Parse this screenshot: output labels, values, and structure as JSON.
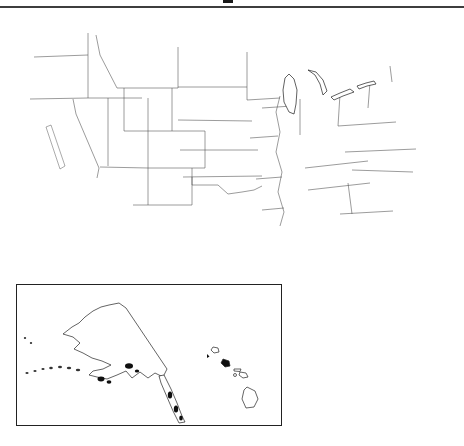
{
  "figure": {
    "kind": "county choropleth map",
    "region": "United States",
    "inset": "Alaska and Hawaii"
  },
  "legend": {
    "items": [
      {
        "label": "0 to 1.3 percent",
        "pattern": "white"
      },
      {
        "label": "1.3 to 1.9 percent",
        "pattern": "dots"
      },
      {
        "label": "1.9 to 2.6 percent",
        "pattern": "gray"
      },
      {
        "label": "2.6 to 3.9 percent",
        "pattern": "hatch"
      },
      {
        "label": "3.9 to 19.9 percent",
        "pattern": "black"
      }
    ]
  },
  "colors": {
    "gray": "#8f8f8f",
    "black": "#0f0f0f",
    "outline": "#1c1c1c",
    "state_line": "#4a4a4a",
    "rule": "#3d3d3d"
  },
  "map": {
    "counties": [
      [
        "b",
        46,
        33,
        11,
        8
      ],
      [
        "b",
        32,
        118,
        24,
        28
      ],
      [
        "b",
        57,
        120,
        36,
        30
      ],
      [
        "b",
        48,
        148,
        34,
        26
      ],
      [
        "b",
        36,
        162,
        14,
        16
      ],
      [
        "b",
        72,
        154,
        18,
        14
      ],
      [
        "b",
        131,
        160,
        15,
        16
      ],
      [
        "b",
        118,
        179,
        6,
        5
      ],
      [
        "b",
        219,
        166,
        14,
        11
      ],
      [
        "b",
        201,
        184,
        7,
        5
      ],
      [
        "b",
        293,
        114,
        10,
        9
      ],
      [
        "b",
        228,
        112,
        5,
        4
      ],
      [
        "b",
        398,
        89,
        8,
        7
      ],
      [
        "b",
        406,
        95,
        9,
        8
      ],
      [
        "b",
        414,
        102,
        8,
        5
      ],
      [
        "b",
        403,
        107,
        6,
        4
      ],
      [
        "b",
        394,
        98,
        5,
        4
      ],
      [
        "b",
        422,
        81,
        5,
        4
      ],
      [
        "b",
        286,
        231,
        6,
        5
      ],
      [
        "b",
        377,
        152,
        5,
        4
      ],
      [
        "b",
        429,
        69,
        4,
        3
      ],
      [
        "g",
        120,
        57,
        9,
        7
      ],
      [
        "g",
        80,
        85,
        7,
        6
      ],
      [
        "g",
        92,
        122,
        9,
        9
      ],
      [
        "g",
        102,
        152,
        9,
        11
      ],
      [
        "g",
        144,
        134,
        8,
        8
      ],
      [
        "g",
        188,
        114,
        6,
        5
      ],
      [
        "g",
        234,
        138,
        10,
        8
      ],
      [
        "g",
        212,
        153,
        9,
        7
      ],
      [
        "g",
        222,
        161,
        6,
        5
      ],
      [
        "g",
        248,
        171,
        8,
        6
      ],
      [
        "g",
        214,
        197,
        14,
        12
      ],
      [
        "g",
        209,
        227,
        8,
        6
      ],
      [
        "g",
        231,
        241,
        9,
        5
      ],
      [
        "g",
        181,
        185,
        7,
        5
      ],
      [
        "g",
        158,
        178,
        6,
        5
      ],
      [
        "g",
        190,
        212,
        7,
        5
      ],
      [
        "g",
        238,
        83,
        13,
        9
      ],
      [
        "g",
        264,
        108,
        11,
        10
      ],
      [
        "g",
        283,
        112,
        11,
        9
      ],
      [
        "g",
        306,
        102,
        14,
        11
      ],
      [
        "g",
        316,
        108,
        7,
        6
      ],
      [
        "g",
        274,
        130,
        7,
        6
      ],
      [
        "g",
        297,
        223,
        8,
        5
      ],
      [
        "g",
        319,
        227,
        7,
        4
      ],
      [
        "g",
        344,
        239,
        8,
        10
      ],
      [
        "g",
        357,
        253,
        9,
        7
      ],
      [
        "g",
        363,
        267,
        7,
        4
      ],
      [
        "g",
        345,
        121,
        7,
        5
      ],
      [
        "g",
        372,
        109,
        7,
        5
      ],
      [
        "g",
        392,
        73,
        7,
        5
      ],
      [
        "g",
        412,
        69,
        6,
        4
      ],
      [
        "g",
        249,
        93,
        6,
        5
      ],
      [
        "g",
        302,
        136,
        6,
        5
      ],
      [
        "g",
        331,
        181,
        7,
        4
      ],
      [
        "g",
        418,
        161,
        6,
        4
      ],
      [
        "d",
        243,
        55,
        9,
        12
      ],
      [
        "d",
        143,
        98,
        11,
        10
      ],
      [
        "d",
        247,
        67,
        7,
        6
      ],
      [
        "d",
        206,
        146,
        7,
        5
      ],
      [
        "d",
        389,
        83,
        5,
        4
      ],
      [
        "d",
        356,
        196,
        6,
        4
      ],
      [
        "h",
        52,
        39,
        9,
        6
      ],
      [
        "h",
        62,
        45,
        8,
        5
      ],
      [
        "h",
        58,
        104,
        13,
        10
      ],
      [
        "h",
        29,
        99,
        12,
        8
      ],
      [
        "h",
        41,
        111,
        8,
        6
      ],
      [
        "h",
        28,
        161,
        13,
        10
      ],
      [
        "h",
        38,
        173,
        10,
        8
      ],
      [
        "h",
        104,
        187,
        11,
        8
      ],
      [
        "h",
        136,
        203,
        8,
        6
      ],
      [
        "w",
        60,
        70,
        8,
        6
      ],
      [
        "w",
        75,
        108,
        7,
        5
      ],
      [
        "w",
        110,
        70,
        8,
        6
      ],
      [
        "w",
        140,
        60,
        7,
        5
      ],
      [
        "w",
        162,
        75,
        8,
        6
      ],
      [
        "w",
        186,
        60,
        7,
        6
      ],
      [
        "w",
        205,
        70,
        7,
        5
      ],
      [
        "w",
        225,
        62,
        6,
        5
      ],
      [
        "w",
        150,
        145,
        8,
        6
      ],
      [
        "w",
        165,
        160,
        7,
        5
      ],
      [
        "w",
        175,
        130,
        6,
        5
      ],
      [
        "w",
        200,
        120,
        7,
        6
      ],
      [
        "w",
        220,
        90,
        7,
        5
      ],
      [
        "w",
        196,
        105,
        7,
        5
      ],
      [
        "w",
        230,
        98,
        6,
        5
      ],
      [
        "w",
        152,
        90,
        8,
        6
      ],
      [
        "w",
        118,
        120,
        7,
        5
      ],
      [
        "w",
        128,
        142,
        6,
        5
      ],
      [
        "w",
        160,
        185,
        7,
        6
      ],
      [
        "w",
        150,
        200,
        6,
        5
      ],
      [
        "w",
        170,
        205,
        6,
        5
      ],
      [
        "w",
        185,
        230,
        7,
        5
      ],
      [
        "w",
        200,
        245,
        6,
        5
      ],
      [
        "w",
        215,
        235,
        6,
        5
      ],
      [
        "w",
        225,
        210,
        7,
        6
      ],
      [
        "w",
        238,
        205,
        6,
        5
      ],
      [
        "w",
        255,
        205,
        7,
        5
      ],
      [
        "w",
        250,
        185,
        6,
        5
      ],
      [
        "w",
        265,
        170,
        6,
        5
      ],
      [
        "w",
        260,
        155,
        6,
        5
      ],
      [
        "w",
        270,
        145,
        6,
        5
      ],
      [
        "w",
        255,
        135,
        6,
        5
      ],
      [
        "w",
        265,
        120,
        6,
        5
      ],
      [
        "w",
        250,
        105,
        6,
        5
      ],
      [
        "w",
        272,
        95,
        6,
        5
      ],
      [
        "w",
        262,
        85,
        6,
        5
      ],
      [
        "w",
        288,
        85,
        5,
        4
      ],
      [
        "w",
        252,
        70,
        7,
        5
      ],
      [
        "w",
        268,
        78,
        6,
        5
      ],
      [
        "w",
        243,
        110,
        6,
        5
      ],
      [
        "w",
        238,
        125,
        6,
        5
      ],
      [
        "w",
        232,
        150,
        6,
        5
      ],
      [
        "w",
        252,
        160,
        6,
        5
      ],
      [
        "w",
        246,
        178,
        6,
        5
      ],
      [
        "w",
        260,
        190,
        6,
        5
      ],
      [
        "w",
        270,
        200,
        6,
        5
      ],
      [
        "w",
        282,
        195,
        6,
        5
      ],
      [
        "w",
        290,
        205,
        6,
        5
      ],
      [
        "w",
        296,
        178,
        6,
        5
      ],
      [
        "w",
        290,
        150,
        6,
        5
      ],
      [
        "w",
        282,
        140,
        6,
        5
      ],
      [
        "w",
        295,
        128,
        6,
        5
      ],
      [
        "w",
        308,
        112,
        6,
        5
      ],
      [
        "w",
        305,
        92,
        6,
        5
      ],
      [
        "w",
        315,
        122,
        6,
        5
      ],
      [
        "w",
        318,
        135,
        6,
        5
      ],
      [
        "w",
        312,
        155,
        6,
        5
      ],
      [
        "w",
        322,
        165,
        6,
        5
      ],
      [
        "w",
        330,
        150,
        6,
        5
      ],
      [
        "w",
        338,
        140,
        6,
        5
      ],
      [
        "w",
        330,
        115,
        6,
        5
      ],
      [
        "w",
        322,
        105,
        6,
        5
      ],
      [
        "w",
        340,
        105,
        6,
        5
      ],
      [
        "w",
        352,
        98,
        6,
        5
      ],
      [
        "w",
        360,
        112,
        6,
        5
      ],
      [
        "w",
        368,
        130,
        6,
        5
      ],
      [
        "w",
        375,
        140,
        6,
        5
      ],
      [
        "w",
        380,
        155,
        6,
        5
      ],
      [
        "w",
        372,
        168,
        6,
        5
      ],
      [
        "w",
        362,
        178,
        6,
        5
      ],
      [
        "w",
        352,
        190,
        6,
        5
      ],
      [
        "w",
        342,
        200,
        6,
        5
      ],
      [
        "w",
        335,
        210,
        6,
        5
      ],
      [
        "w",
        345,
        222,
        6,
        5
      ],
      [
        "w",
        355,
        232,
        6,
        5
      ],
      [
        "w",
        360,
        248,
        5,
        4
      ],
      [
        "w",
        356,
        260,
        5,
        4
      ],
      [
        "w",
        300,
        210,
        6,
        4
      ],
      [
        "w",
        310,
        222,
        6,
        4
      ],
      [
        "w",
        322,
        230,
        6,
        4
      ],
      [
        "w",
        292,
        232,
        6,
        4
      ],
      [
        "w",
        272,
        230,
        6,
        4
      ],
      [
        "w",
        262,
        222,
        6,
        4
      ],
      [
        "w",
        252,
        230,
        5,
        4
      ],
      [
        "w",
        243,
        244,
        5,
        4
      ],
      [
        "w",
        228,
        247,
        5,
        4
      ],
      [
        "w",
        205,
        230,
        6,
        5
      ],
      [
        "w",
        196,
        220,
        6,
        5
      ],
      [
        "w",
        410,
        60,
        5,
        4
      ],
      [
        "w",
        418,
        66,
        5,
        4
      ],
      [
        "w",
        404,
        70,
        5,
        4
      ],
      [
        "w",
        396,
        76,
        5,
        4
      ],
      [
        "w",
        404,
        82,
        5,
        4
      ],
      [
        "w",
        412,
        88,
        5,
        4
      ],
      [
        "w",
        400,
        92,
        5,
        4
      ],
      [
        "w",
        390,
        88,
        5,
        4
      ],
      [
        "w",
        386,
        98,
        5,
        4
      ],
      [
        "w",
        394,
        106,
        5,
        4
      ],
      [
        "w",
        402,
        112,
        4,
        3
      ],
      [
        "w",
        396,
        118,
        5,
        4
      ],
      [
        "w",
        388,
        126,
        5,
        4
      ],
      [
        "w",
        396,
        134,
        5,
        4
      ],
      [
        "w",
        388,
        142,
        5,
        4
      ],
      [
        "w",
        398,
        150,
        5,
        4
      ],
      [
        "w",
        406,
        158,
        5,
        4
      ],
      [
        "w",
        400,
        166,
        5,
        4
      ],
      [
        "w",
        408,
        174,
        5,
        4
      ],
      [
        "w",
        398,
        178,
        5,
        4
      ],
      [
        "w",
        390,
        170,
        5,
        4
      ],
      [
        "w",
        382,
        162,
        5,
        4
      ],
      [
        "w",
        374,
        152,
        5,
        4
      ],
      [
        "w",
        366,
        162,
        5,
        4
      ],
      [
        "w",
        358,
        152,
        5,
        4
      ],
      [
        "w",
        350,
        162,
        5,
        4
      ],
      [
        "w",
        342,
        172,
        5,
        4
      ],
      [
        "w",
        334,
        162,
        5,
        4
      ],
      [
        "w",
        326,
        175,
        5,
        4
      ],
      [
        "w",
        318,
        185,
        5,
        4
      ],
      [
        "w",
        310,
        192,
        5,
        4
      ],
      [
        "w",
        302,
        185,
        5,
        4
      ],
      [
        "w",
        294,
        192,
        5,
        4
      ],
      [
        "w",
        286,
        202,
        5,
        4
      ],
      [
        "w",
        278,
        210,
        5,
        4
      ],
      [
        "w",
        348,
        242,
        5,
        4
      ],
      [
        "w",
        168,
        178,
        7,
        5
      ],
      [
        "w",
        152,
        162,
        7,
        5
      ],
      [
        "w",
        142,
        178,
        6,
        5
      ],
      [
        "w",
        192,
        140,
        6,
        5
      ],
      [
        "w",
        180,
        160,
        6,
        5
      ],
      [
        "w",
        162,
        196,
        6,
        5
      ]
    ]
  }
}
